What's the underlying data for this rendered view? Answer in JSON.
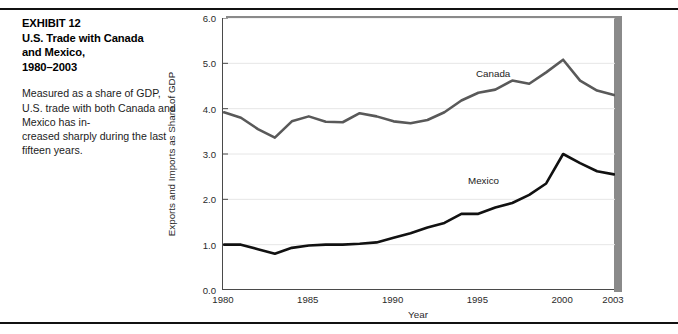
{
  "figure": {
    "exhibit_label": "EXHIBIT 12",
    "title": "EXHIBIT 12\nU.S. Trade with Canada\nand Mexico,\n1980–2003",
    "description": "Measured as a share of GDP, U.S. trade with both Canada and Mexico has in-\ncreased sharply during the last fifteen years."
  },
  "chart_data": {
    "type": "line",
    "title": "U.S. Trade with Canada and Mexico, 1980–2003",
    "xlabel": "Year",
    "ylabel": "Exports and Imports as Share of GDP",
    "xlim": [
      1980,
      2003
    ],
    "ylim": [
      0.0,
      6.0
    ],
    "xticks": [
      1980,
      1985,
      1990,
      1995,
      2000,
      2003
    ],
    "xtick_labels": [
      "1980",
      "1985",
      "1990",
      "1995",
      "2000",
      "2003"
    ],
    "yticks": [
      0.0,
      1.0,
      2.0,
      3.0,
      4.0,
      5.0,
      6.0
    ],
    "ytick_labels": [
      "0.0",
      "1.0",
      "2.0",
      "3.0",
      "4.0",
      "5.0",
      "6.0"
    ],
    "grid": "horizontal",
    "legend_position": "inline-labels",
    "x": [
      1980,
      1981,
      1982,
      1983,
      1984,
      1985,
      1986,
      1987,
      1988,
      1989,
      1990,
      1991,
      1992,
      1993,
      1994,
      1995,
      1996,
      1997,
      1998,
      1999,
      2000,
      2001,
      2002,
      2003
    ],
    "series": [
      {
        "name": "Canada",
        "color": "#595959",
        "width": 2.6,
        "values": [
          3.92,
          3.8,
          3.55,
          3.36,
          3.72,
          3.83,
          3.71,
          3.7,
          3.9,
          3.83,
          3.72,
          3.68,
          3.75,
          3.92,
          4.18,
          4.35,
          4.42,
          4.62,
          4.55,
          4.8,
          5.08,
          4.62,
          4.4,
          4.3
        ]
      },
      {
        "name": "Mexico",
        "color": "#111111",
        "width": 2.6,
        "values": [
          1.0,
          1.0,
          0.9,
          0.8,
          0.93,
          0.98,
          1.0,
          1.0,
          1.02,
          1.05,
          1.15,
          1.25,
          1.38,
          1.48,
          1.68,
          1.68,
          1.82,
          1.92,
          2.1,
          2.35,
          3.0,
          2.8,
          2.62,
          2.55
        ]
      }
    ],
    "annotations": [
      {
        "text": "Canada",
        "x": 1996,
        "y": 4.95
      },
      {
        "text": "Mexico",
        "x": 1995.6,
        "y": 2.55
      }
    ]
  }
}
